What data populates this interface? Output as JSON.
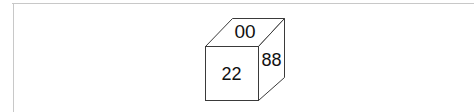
{
  "diagram": {
    "type": "cube",
    "colors": {
      "stroke": "#3a3a3a",
      "frame": "#c8c8c8",
      "background": "#ffffff",
      "text": "#111111"
    },
    "faces": {
      "top": {
        "label": "00"
      },
      "front": {
        "label": "22"
      },
      "right": {
        "label": "88"
      }
    }
  }
}
